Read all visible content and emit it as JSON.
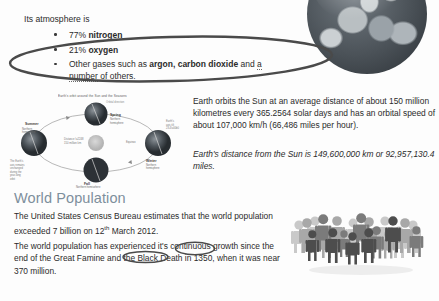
{
  "document": {
    "intro_line": "Its atmosphere is",
    "atmosphere_bullets": [
      {
        "plain_prefix": "77% ",
        "bold": "nitrogen",
        "plain_suffix": ""
      },
      {
        "plain_prefix": "21% ",
        "bold": "oxygen",
        "plain_suffix": ""
      },
      {
        "plain_prefix": "Other gases such as ",
        "bold": "argon, carbon dioxide",
        "plain_suffix": " and ",
        "underlined": "a number",
        "plain_tail": "of others."
      }
    ],
    "orbit_caption": "Earth's orbit around the Sun and the Seasons",
    "paragraph_orbit": "Earth orbits the Sun at an average distance of about 150 million kilometres every 365.2564 solar days and has an orbital speed of about 107,000 km/h (66,486 miles per hour).",
    "paragraph_distance": "Earth's distance from the Sun is 149,600,000 km or 92,957,130.4 miles.",
    "heading_world_population": "World Population",
    "paragraph_census_before_sup": "The United States Census Bureau estimates that the world population exceeded 7 billion on 12",
    "paragraph_census_sup": "th",
    "paragraph_census_after_sup": " March 2012.",
    "paragraph_growth": "The world population has experienced it's continuous growth since the end of the Great Famine and the Black Death in 1350, when it was near 370 million."
  },
  "annotations": [
    {
      "name": "ellipse-around-atmosphere-bullets",
      "target": "21% oxygen / Other gases such as argon, carbon dioxide and a number"
    },
    {
      "name": "ellipse-around-its",
      "target": "it's"
    },
    {
      "name": "ellipse-around-famine",
      "target": "Famin"
    }
  ],
  "images": {
    "earth_photo_alt": "Photograph of Earth from space",
    "orbit_diagram_alt": "Diagram of Earth's orbit around the Sun showing the four seasons",
    "crowd_graphic_alt": "Illustration of a crowd of people representing world population"
  },
  "orbit_diagram": {
    "sun_label": "Sun",
    "season_labels": [
      "Summer",
      "Spring",
      "Fall",
      "Winter"
    ],
    "orbit_note": "Distance ≈ 150 million km"
  },
  "colors": {
    "page_background": "#fdfdfd",
    "body_text": "#2b2b2b",
    "heading": "#7d8f9c",
    "annotation_stroke": "#4a4a4a",
    "bullet_dot": "#3a3a3a"
  }
}
